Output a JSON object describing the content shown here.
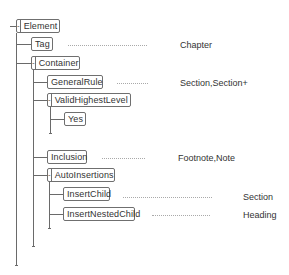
{
  "diagram": {
    "type": "tree",
    "nodes": [
      {
        "id": "element",
        "label": "Element",
        "collapsible": true,
        "toggle": "-"
      },
      {
        "id": "tag",
        "label": "Tag",
        "collapsible": false,
        "value": "Chapter"
      },
      {
        "id": "container",
        "label": "Container",
        "collapsible": true,
        "toggle": "-"
      },
      {
        "id": "generalrule",
        "label": "GeneralRule",
        "collapsible": false,
        "value": "Section,Section+"
      },
      {
        "id": "validhighestlevel",
        "label": "ValidHighestLevel",
        "collapsible": true,
        "toggle": "-"
      },
      {
        "id": "yes",
        "label": "Yes",
        "collapsible": false
      },
      {
        "id": "inclusion",
        "label": "Inclusion",
        "collapsible": false,
        "value": "Footnote,Note"
      },
      {
        "id": "autoinsertions",
        "label": "AutoInsertions",
        "collapsible": true,
        "toggle": "-"
      },
      {
        "id": "insertchild",
        "label": "InsertChild",
        "collapsible": false,
        "value": "Section"
      },
      {
        "id": "insertnestedchild",
        "label": "InsertNestedChild",
        "collapsible": false,
        "value": "Heading"
      }
    ],
    "edges": [
      [
        "element",
        "tag"
      ],
      [
        "element",
        "container"
      ],
      [
        "container",
        "generalrule"
      ],
      [
        "container",
        "validhighestlevel"
      ],
      [
        "validhighestlevel",
        "yes"
      ],
      [
        "container",
        "inclusion"
      ],
      [
        "container",
        "autoinsertions"
      ],
      [
        "autoinsertions",
        "insertchild"
      ],
      [
        "autoinsertions",
        "insertnestedchild"
      ]
    ]
  }
}
